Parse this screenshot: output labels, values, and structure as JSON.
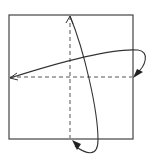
{
  "diagram": {
    "type": "origami-fold-instruction",
    "paper": {
      "shape": "square",
      "stroke": "#444444",
      "fill": "#ffffff"
    },
    "fold_lines": [
      {
        "name": "vertical-valley-fold",
        "style": "dashed",
        "orientation": "vertical"
      },
      {
        "name": "horizontal-valley-fold",
        "style": "dashed",
        "orientation": "horizontal"
      }
    ],
    "arrows": [
      {
        "name": "fold-arrow-right-to-left",
        "from": "right edge midpoint",
        "to": "left edge midpoint",
        "head_end": "open",
        "head_start": "filled"
      },
      {
        "name": "fold-arrow-bottom-to-top",
        "from": "bottom edge midpoint",
        "to": "top edge midpoint",
        "head_end": "open",
        "head_start": "filled"
      }
    ],
    "colors": {
      "line": "#333333",
      "dash": "#555555"
    }
  }
}
